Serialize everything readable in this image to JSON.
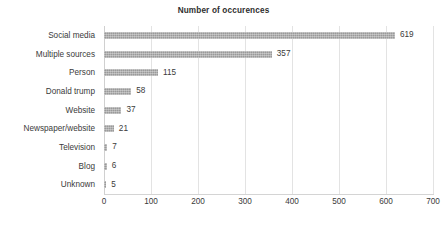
{
  "chart_data": {
    "type": "bar",
    "orientation": "horizontal",
    "title": "Number of occurences",
    "xlabel": "",
    "ylabel": "",
    "categories": [
      "Unknown",
      "Blog",
      "Television",
      "Newspaper/website",
      "Website",
      "Donald trump",
      "Person",
      "Multiple sources",
      "Social media"
    ],
    "values": [
      5,
      6,
      7,
      21,
      37,
      58,
      115,
      357,
      619
    ],
    "data_labels": [
      "5",
      "6",
      "7",
      "21",
      "37",
      "58",
      "115",
      "357",
      "619"
    ],
    "xlim": [
      0,
      700
    ],
    "xticks": [
      0,
      100,
      200,
      300,
      400,
      500,
      600,
      700
    ],
    "xtick_labels": [
      "0",
      "100",
      "200",
      "300",
      "400",
      "500",
      "600",
      "700"
    ],
    "grid": "vertical",
    "legend": null,
    "bar_color": "#9a9a9a",
    "gridline_color": "#e3e3e3",
    "text_color": "#3a3a3a",
    "title_color": "#2e2e2e",
    "background": "#ffffff"
  }
}
